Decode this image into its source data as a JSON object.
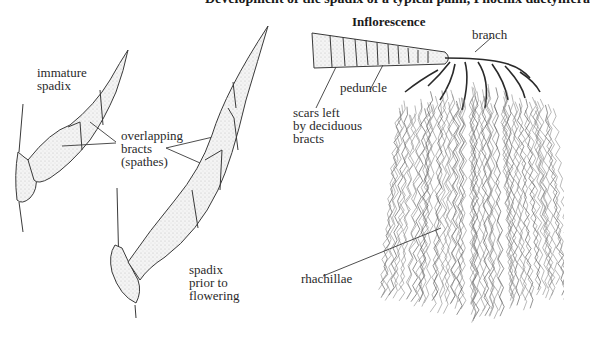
{
  "figure": {
    "top_caption_partial": "Development of the spadix of a typical palm, Phoenix dactylifera",
    "inflorescence_title": "Inflorescence"
  },
  "left_panel": {
    "labels": {
      "immature_spadix": [
        "immature",
        "spadix"
      ],
      "overlapping_bracts": [
        "overlapping",
        "bracts",
        "(spathes)"
      ],
      "spadix_prior": [
        "spadix",
        "prior to",
        "flowering"
      ]
    }
  },
  "right_panel": {
    "labels": {
      "branch": "branch",
      "peduncle": "peduncle",
      "scars": [
        "scars left",
        "by deciduous",
        "bracts"
      ],
      "rhachillae": "rhachillae"
    }
  },
  "colors": {
    "ink": "#2a2a2a",
    "stipple": "#c8c8c8",
    "background": "#ffffff"
  }
}
